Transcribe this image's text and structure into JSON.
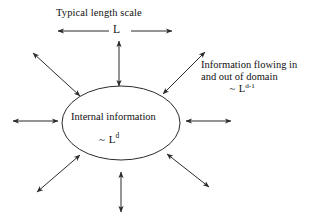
{
  "figure": {
    "kind": "annotated-diagram",
    "background_color": "#ffffff",
    "stroke_color": "#2b2b2b",
    "text_color": "#111111",
    "width": 315,
    "height": 223
  },
  "labels": {
    "top_title": "Typical length scale",
    "length_symbol": "L",
    "right_line1": "Information flowing in",
    "right_line2": "and out of domain",
    "right_scale_tilde": "~",
    "right_scale_base": "L",
    "right_scale_exponent": "d-1",
    "inner_title": "Internal information",
    "inner_scale_tilde": "~",
    "inner_scale_base": "L",
    "inner_scale_exponent": "d"
  },
  "shapes": {
    "domain_ellipse": {
      "name": "domain-ellipse",
      "cx": 121,
      "cy": 123,
      "rx": 59,
      "ry": 37,
      "fill": "none",
      "stroke": "#2b2b2b",
      "stroke_width": 1
    }
  },
  "arrows": [
    {
      "name": "length-scale-double-arrow",
      "heads": "both",
      "x1": 58,
      "y1": 31,
      "x2": 172,
      "y2": 31,
      "gap_start": 108,
      "gap_end": 131
    },
    {
      "name": "arrow-top",
      "heads": "both",
      "x1": 119,
      "y1": 41,
      "x2": 119,
      "y2": 86
    },
    {
      "name": "arrow-bottom",
      "heads": "both",
      "x1": 121,
      "y1": 172,
      "x2": 121,
      "y2": 212
    },
    {
      "name": "arrow-left",
      "heads": "both",
      "x1": 13,
      "y1": 121,
      "x2": 58,
      "y2": 121
    },
    {
      "name": "arrow-right",
      "heads": "both",
      "x1": 186,
      "y1": 121,
      "x2": 231,
      "y2": 121
    },
    {
      "name": "arrow-upper-left",
      "heads": "both",
      "x1": 80,
      "y1": 96,
      "x2": 33,
      "y2": 53
    },
    {
      "name": "arrow-upper-right",
      "heads": "both",
      "x1": 163,
      "y1": 94,
      "x2": 205,
      "y2": 52
    },
    {
      "name": "arrow-lower-left",
      "heads": "both",
      "x1": 80,
      "y1": 155,
      "x2": 37,
      "y2": 192
    },
    {
      "name": "arrow-lower-right",
      "heads": "both",
      "x1": 167,
      "y1": 154,
      "x2": 209,
      "y2": 187
    }
  ]
}
